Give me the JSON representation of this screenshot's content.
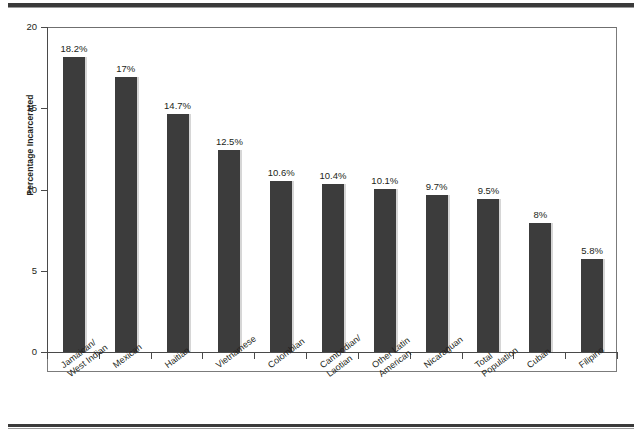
{
  "chart_data": {
    "type": "bar",
    "title": "",
    "subtitle": "",
    "xlabel": "",
    "ylabel": "Percentage Incarcerated",
    "ylim": [
      0,
      20
    ],
    "yticks": [
      0,
      5,
      10,
      15,
      20
    ],
    "ytick_labels": [
      "0",
      "5",
      "10",
      "15",
      "20"
    ],
    "grid": false,
    "legend": null,
    "bar_color": "#3c3c3c",
    "axis_color": "#4a4a4a",
    "frame_color": "#7b7b7b",
    "categories": [
      "Jamaican/ West Indian",
      "Mexican",
      "Haitian",
      "Vietnamese",
      "Colombian",
      "Cambodian/ Laotian",
      "Other Latin American",
      "Nicaraguan",
      "Total Population",
      "Cuban",
      "Filipino"
    ],
    "category_lines": [
      [
        "Jamaican/",
        "West Indian"
      ],
      [
        "Mexican",
        ""
      ],
      [
        "Haitian",
        ""
      ],
      [
        "Vietnamese",
        ""
      ],
      [
        "Colombian",
        ""
      ],
      [
        "Cambodian/",
        "Laotian"
      ],
      [
        "Other Latin",
        "American"
      ],
      [
        "Nicaraguan",
        ""
      ],
      [
        "Total",
        "Population"
      ],
      [
        "Cuban",
        ""
      ],
      [
        "Filipino",
        ""
      ]
    ],
    "values": [
      18.2,
      17,
      14.7,
      12.5,
      10.6,
      10.4,
      10.1,
      9.7,
      9.5,
      8,
      5.8
    ],
    "data_labels": [
      "18.2%",
      "17%",
      "14.7%",
      "12.5%",
      "10.6%",
      "10.4%",
      "10.1%",
      "9.7%",
      "9.5%",
      "8%",
      "5.8%"
    ]
  }
}
